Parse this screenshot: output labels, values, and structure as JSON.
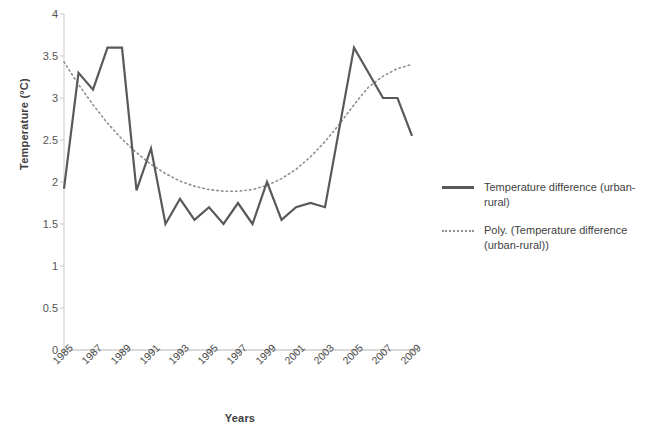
{
  "chart_data": {
    "type": "line",
    "title": "",
    "xlabel": "Years",
    "ylabel": "Temperature (°C)",
    "ylim": [
      0,
      4
    ],
    "ytick_labels": [
      "4",
      "3.5",
      "3",
      "2.5",
      "2",
      "1.5",
      "1",
      "0.5",
      "0"
    ],
    "ytick_values": [
      4,
      3.5,
      3,
      2.5,
      2,
      1.5,
      1,
      0.5,
      0
    ],
    "xtick_labels": [
      "1985",
      "1987",
      "1989",
      "1991",
      "1993",
      "1995",
      "1997",
      "1999",
      "2001",
      "2003",
      "2005",
      "2007",
      "2009"
    ],
    "xtick_values": [
      1985,
      1987,
      1989,
      1991,
      1993,
      1995,
      1997,
      1999,
      2001,
      2003,
      2005,
      2007,
      2009
    ],
    "xlim": [
      1985,
      2009
    ],
    "grid": false,
    "legend_position": "right",
    "series": [
      {
        "name": "Temperature difference (urban-rural)",
        "style": "solid",
        "color": "#595959",
        "x": [
          1985,
          1986,
          1987,
          1988,
          1989,
          1990,
          1991,
          1992,
          1993,
          1994,
          1995,
          1996,
          1997,
          1998,
          1999,
          2000,
          2001,
          2002,
          2003,
          2004,
          2005,
          2006,
          2007,
          2008,
          2009
        ],
        "values": [
          1.92,
          3.3,
          3.1,
          3.6,
          3.6,
          1.9,
          2.4,
          1.5,
          1.8,
          1.55,
          1.7,
          1.5,
          1.75,
          1.5,
          2.0,
          1.55,
          1.7,
          1.75,
          1.7,
          2.65,
          3.6,
          3.3,
          3.0,
          3.0,
          2.55
        ]
      },
      {
        "name": "Poly. (Temperature difference (urban-rural))",
        "style": "dotted",
        "color": "#8f8f8f",
        "x": [
          1985,
          1986,
          1987,
          1988,
          1989,
          1990,
          1991,
          1992,
          1993,
          1994,
          1995,
          1996,
          1997,
          1998,
          1999,
          2000,
          2001,
          2002,
          2003,
          2004,
          2005,
          2006,
          2007,
          2008,
          2009
        ],
        "values": [
          3.43,
          3.16,
          2.92,
          2.7,
          2.51,
          2.35,
          2.21,
          2.1,
          2.01,
          1.95,
          1.91,
          1.89,
          1.89,
          1.91,
          1.96,
          2.04,
          2.15,
          2.3,
          2.48,
          2.69,
          2.92,
          3.13,
          3.26,
          3.35,
          3.4
        ]
      }
    ]
  },
  "legend": {
    "items": [
      {
        "label": "Temperature difference (urban-rural)",
        "style": "solid"
      },
      {
        "label": "Poly. (Temperature difference (urban-rural))",
        "style": "dotted"
      }
    ]
  }
}
